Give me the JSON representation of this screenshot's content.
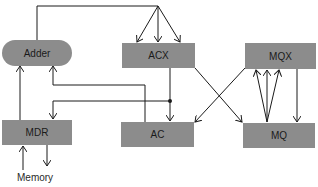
{
  "diagram": {
    "nodes": {
      "adder": "Adder",
      "acx": "ACX",
      "mqx": "MQX",
      "mdr": "MDR",
      "ac": "AC",
      "mq": "MQ"
    },
    "external": {
      "memory": "Memory"
    },
    "colors": {
      "box_fill": "#8c8c8c",
      "line": "#1a1a1a",
      "background": "#ffffff"
    },
    "edges": [
      {
        "from": "Adder",
        "to": "ACX",
        "note": "Adder output fans to three ACX inputs"
      },
      {
        "from": "MDR",
        "to": "Adder"
      },
      {
        "from": "AC",
        "to": "Adder"
      },
      {
        "from": "ACX",
        "to": "AC"
      },
      {
        "from": "ACX",
        "to": "MDR",
        "note": "branch from ACX→AC line at junction dot"
      },
      {
        "from": "ACX",
        "to": "MQ"
      },
      {
        "from": "MQX",
        "to": "AC"
      },
      {
        "from": "MQ",
        "to": "MQX",
        "note": "three arrows fan from MQ into MQX"
      },
      {
        "from": "MQX",
        "to": "MQ"
      },
      {
        "from": "Memory",
        "to": "MDR"
      },
      {
        "from": "MDR",
        "to": "Memory"
      }
    ]
  }
}
